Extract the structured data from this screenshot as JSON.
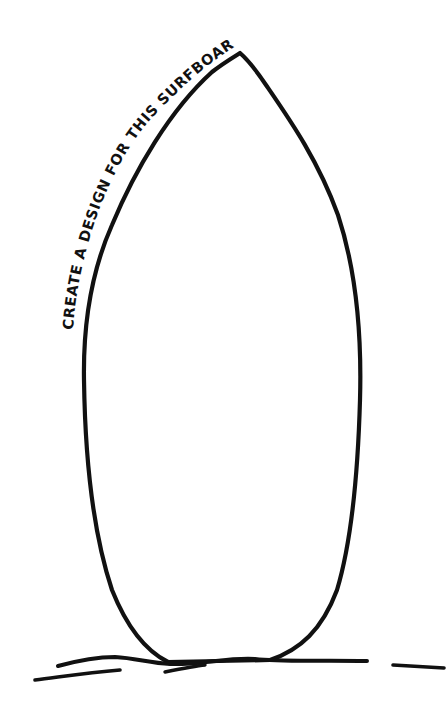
{
  "prompt": {
    "text": "CREATE A DESIGN FOR THIS SURFBOARD."
  },
  "illustration": {
    "subject": "surfboard-outline",
    "ink_color": "#111111",
    "background_color": "#ffffff"
  }
}
